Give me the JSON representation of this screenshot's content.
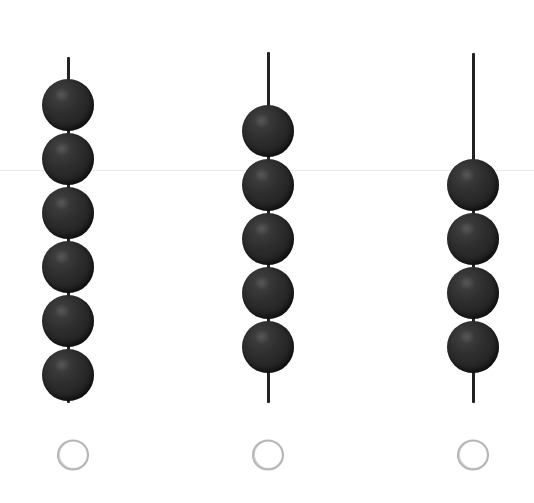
{
  "page": {
    "background_color": "#ffffff",
    "width": 534,
    "height": 503
  },
  "guide_line": {
    "name": "faint-horizontal-rule",
    "y": 170,
    "color": "#eceaea",
    "thickness": 1
  },
  "style": {
    "bead_color": "#2b2b2b",
    "bead_highlight_color": "#4a4a4a",
    "rod_color": "#222222",
    "answer_circle_color": "#b3b3b3"
  },
  "chart_data": {
    "type": "bar",
    "xlabel": "",
    "ylabel": "Number of beads",
    "categories": [
      "Column 1",
      "Column 2",
      "Column 3"
    ],
    "values": [
      6,
      5,
      4
    ],
    "ylim": [
      0,
      6
    ],
    "grid": false,
    "legend": "none"
  },
  "columns": [
    {
      "name": "bead-column-1",
      "index": 1,
      "bead_count": 6,
      "center_x": 68,
      "bead_diameter": 52,
      "bead_spacing": 54,
      "first_bead_center_y": 105,
      "rod": {
        "top_y": 57,
        "bottom_y": 403
      },
      "answer_circle": {
        "center_x": 73,
        "center_y": 455,
        "radius": 15
      }
    },
    {
      "name": "bead-column-2",
      "index": 2,
      "bead_count": 5,
      "center_x": 268,
      "bead_diameter": 52,
      "bead_spacing": 54,
      "first_bead_center_y": 131,
      "rod": {
        "top_y": 52,
        "bottom_y": 403
      },
      "answer_circle": {
        "center_x": 268,
        "center_y": 455,
        "radius": 15
      }
    },
    {
      "name": "bead-column-3",
      "index": 3,
      "bead_count": 4,
      "center_x": 473,
      "bead_diameter": 52,
      "bead_spacing": 54,
      "first_bead_center_y": 185,
      "rod": {
        "top_y": 53,
        "bottom_y": 403
      },
      "answer_circle": {
        "center_x": 473,
        "center_y": 455,
        "radius": 15
      }
    }
  ],
  "answers": [
    {
      "name": "answer-circle-1",
      "value": "",
      "placeholder": ""
    },
    {
      "name": "answer-circle-2",
      "value": "",
      "placeholder": ""
    },
    {
      "name": "answer-circle-3",
      "value": "",
      "placeholder": ""
    }
  ]
}
